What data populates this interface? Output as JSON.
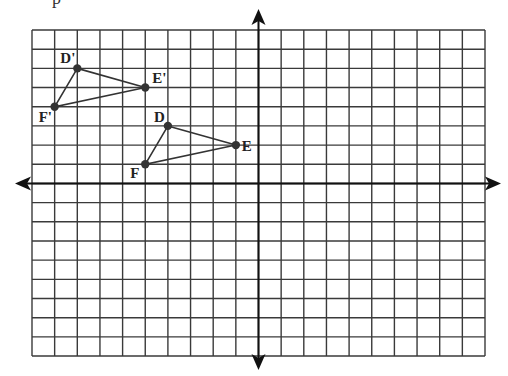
{
  "header": {
    "cut_off_text": "p"
  },
  "grid": {
    "left": 32,
    "top": 30,
    "cell_w": 22.65,
    "cell_h": 19.18,
    "cols": 20,
    "rows": 17,
    "x_axis_row": 8,
    "y_axis_col": 10,
    "x_range": [
      -10,
      10
    ],
    "y_range": [
      -9,
      8
    ],
    "grid_color": "#3a3a3a",
    "axis_color": "#111111",
    "point_color": "#333333",
    "line_color": "#333333"
  },
  "axes": {
    "arrows": [
      "up",
      "down",
      "left",
      "right"
    ]
  },
  "triangles": [
    {
      "name": "DEF",
      "points": [
        {
          "label": "D",
          "x": -4,
          "y": 3,
          "label_dx": -14,
          "label_dy": -4
        },
        {
          "label": "E",
          "x": -1,
          "y": 2,
          "label_dx": 6,
          "label_dy": 6
        },
        {
          "label": "F",
          "x": -5,
          "y": 1,
          "label_dx": -15,
          "label_dy": 14
        }
      ]
    },
    {
      "name": "D'E'F'",
      "points": [
        {
          "label": "D'",
          "x": -8,
          "y": 6,
          "label_dx": -17,
          "label_dy": -5
        },
        {
          "label": "E'",
          "x": -5,
          "y": 5,
          "label_dx": 7,
          "label_dy": -5
        },
        {
          "label": "F'",
          "x": -9,
          "y": 4,
          "label_dx": -16,
          "label_dy": 15
        }
      ]
    }
  ]
}
